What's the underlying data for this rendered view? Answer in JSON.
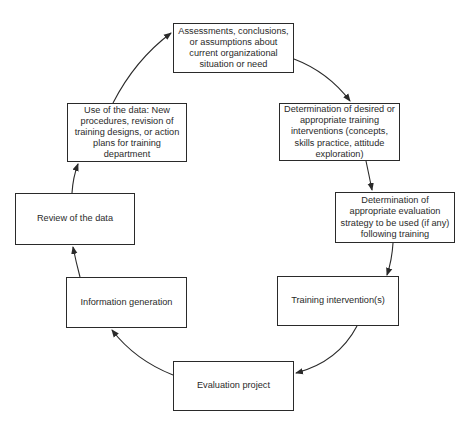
{
  "diagram": {
    "type": "cycle",
    "stroke_color": "#2a2a2a",
    "background": "#ffffff",
    "nodes": [
      {
        "id": "assessments",
        "label": "Assessments, conclusions,\nor assumptions about\ncurrent organizational\nsituation or need"
      },
      {
        "id": "desired-interventions",
        "label": "Determination of desired or\nappropriate training\ninterventions (concepts,\nskills practice, attitude\nexploration)"
      },
      {
        "id": "evaluation-strategy",
        "label": "Determination of\nappropriate evaluation\nstrategy to be used (if any)\nfollowing training"
      },
      {
        "id": "training-intervention",
        "label": "Training intervention(s)"
      },
      {
        "id": "evaluation-project",
        "label": "Evaluation project"
      },
      {
        "id": "information-generation",
        "label": "Information generation"
      },
      {
        "id": "review-data",
        "label": "Review of the data"
      },
      {
        "id": "use-data",
        "label": "Use of the data: New\nprocedures, revision of\ntraining designs, or action\nplans for training\ndepartment"
      }
    ],
    "edges": [
      {
        "from": "assessments",
        "to": "desired-interventions"
      },
      {
        "from": "desired-interventions",
        "to": "evaluation-strategy"
      },
      {
        "from": "evaluation-strategy",
        "to": "training-intervention"
      },
      {
        "from": "training-intervention",
        "to": "evaluation-project"
      },
      {
        "from": "evaluation-project",
        "to": "information-generation"
      },
      {
        "from": "information-generation",
        "to": "review-data"
      },
      {
        "from": "review-data",
        "to": "use-data"
      },
      {
        "from": "use-data",
        "to": "assessments"
      }
    ]
  }
}
